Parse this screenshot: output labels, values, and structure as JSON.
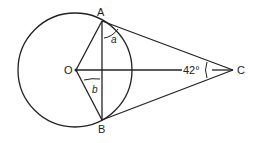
{
  "points": {
    "A": "A",
    "B": "B",
    "C": "C",
    "O": "O"
  },
  "angles": {
    "a": "a",
    "b": "b",
    "C": "42°"
  }
}
